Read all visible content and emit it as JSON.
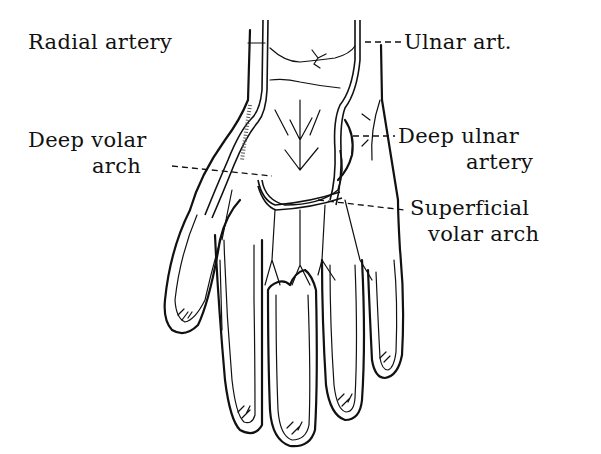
{
  "figure": {
    "labels": {
      "radial_artery": "Radial artery",
      "ulnar_artery": "Ulnar art.",
      "deep_volar_arch_line1": "Deep volar",
      "deep_volar_arch_line2": "arch",
      "deep_ulnar_artery_line1": "Deep ulnar",
      "deep_ulnar_artery_line2": "artery",
      "superficial_volar_arch_line1": "Superficial",
      "superficial_volar_arch_line2": "volar arch"
    },
    "colors": {
      "ink": "#111111",
      "background": "#ffffff"
    }
  }
}
